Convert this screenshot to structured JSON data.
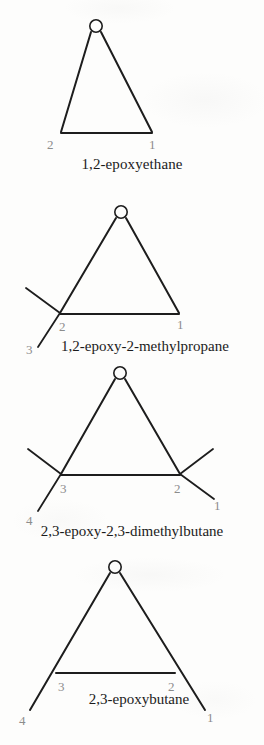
{
  "page": {
    "background_color": "#fdfdfc",
    "ink_color": "#1d1d1d",
    "locant_color": "#8c8c8c",
    "width": 264,
    "height": 745
  },
  "structures": [
    {
      "id": "epoxyethane",
      "caption": "1,2-epoxyethane",
      "heteroatom_label": "O",
      "locants": [
        "2",
        "1"
      ],
      "locant_left": "2",
      "locant_right": "1",
      "substituent_count": 0
    },
    {
      "id": "epoxy-2-methylpropane",
      "caption": "1,2-epoxy-2-methylpropane",
      "heteroatom_label": "O",
      "locants": [
        "2",
        "1",
        "3"
      ],
      "locant_left": "2",
      "locant_right": "1",
      "locant_branch": "3",
      "substituent_count": 2
    },
    {
      "id": "epoxy-dimethylbutane",
      "caption": "2,3-epoxy-2,3-dimethylbutane",
      "heteroatom_label": "O",
      "locants": [
        "3",
        "2",
        "1",
        "4"
      ],
      "locant_left": "3",
      "locant_right": "2",
      "locant_branch_right": "1",
      "locant_branch_left": "4",
      "substituent_count": 4
    },
    {
      "id": "epoxybutane",
      "caption": "2,3-epoxybutane",
      "heteroatom_label": "O",
      "locants": [
        "3",
        "2",
        "4",
        "1"
      ],
      "locant_left": "3",
      "locant_right": "2",
      "locant_branch_left": "4",
      "locant_branch_right": "1",
      "substituent_count": 2
    }
  ]
}
